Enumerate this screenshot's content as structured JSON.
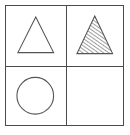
{
  "figure": {
    "frame_color": "#4b4b4b",
    "shape_stroke_color": "#555555",
    "hatch_color": "#3d3d3d",
    "background_color": "#ffffff",
    "rows": 2,
    "columns": 2
  },
  "cells": [
    {
      "id": "r1c1",
      "position": "top-left",
      "row": 1,
      "column": 1,
      "shape": "triangle",
      "fill": "none",
      "outline": "solid",
      "label": "plain triangle",
      "empty": false
    },
    {
      "id": "r1c2",
      "position": "top-right",
      "row": 1,
      "column": 2,
      "shape": "triangle",
      "fill": "diagonal-hatch",
      "hatch_direction": "rising-right",
      "hatch_spacing_px": 3,
      "outline": "solid",
      "label": "hatched triangle",
      "empty": false
    },
    {
      "id": "r2c1",
      "position": "bottom-left",
      "row": 2,
      "column": 1,
      "shape": "circle",
      "fill": "none",
      "outline": "solid",
      "label": "plain circle",
      "empty": false
    },
    {
      "id": "r2c2",
      "position": "bottom-right",
      "row": 2,
      "column": 2,
      "shape": "none",
      "fill": "none",
      "outline": "none",
      "label": "blank panel",
      "empty": true
    }
  ]
}
